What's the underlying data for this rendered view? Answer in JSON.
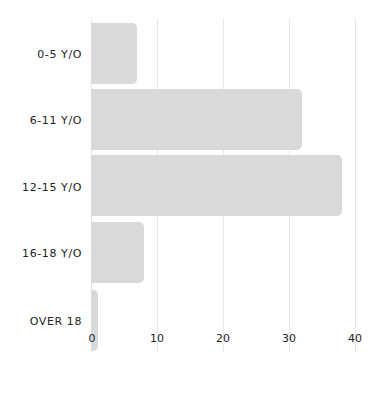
{
  "chart_data": {
    "type": "bar",
    "orientation": "horizontal",
    "title": "",
    "xlabel": "",
    "ylabel": "",
    "categories": [
      "0-5 Y/O",
      "6-11 Y/O",
      "12-15 Y/O",
      "16-18 Y/O",
      "OVER 18"
    ],
    "values": [
      7,
      32,
      38,
      8,
      1
    ],
    "xlim": [
      0,
      40
    ],
    "x_ticks": [
      "0",
      "10",
      "20",
      "30",
      "40"
    ],
    "grid": true,
    "legend": null,
    "bar_color": "#d9d9d9",
    "grid_color": "#e6e6e6"
  }
}
